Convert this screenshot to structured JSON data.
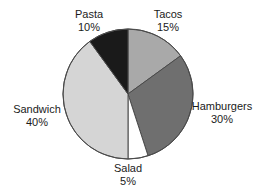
{
  "chart_data": {
    "type": "pie",
    "title": "",
    "subtitle": "",
    "xlabel": "",
    "ylabel": "",
    "legend_position": "none",
    "grid": false,
    "labels_show_percent": true,
    "start_angle_deg": 0,
    "direction": "clockwise",
    "categories": [
      "Tacos",
      "Hamburgers",
      "Salad",
      "Sandwich",
      "Pasta"
    ],
    "values": [
      15,
      30,
      5,
      40,
      10
    ],
    "units": "%",
    "total": 100,
    "slices": [
      {
        "name": "Tacos",
        "value": 15,
        "percent_text": "15%",
        "color": "#a9a9a9",
        "label_text": "Tacos",
        "label_position": "top-right"
      },
      {
        "name": "Hamburgers",
        "value": 30,
        "percent_text": "30%",
        "color": "#6f6f6f",
        "label_text": "Hamburgers",
        "label_position": "right"
      },
      {
        "name": "Salad",
        "value": 5,
        "percent_text": "5%",
        "color": "#ffffff",
        "label_text": "Salad",
        "label_position": "bottom"
      },
      {
        "name": "Sandwich",
        "value": 40,
        "percent_text": "40%",
        "color": "#d5d5d5",
        "label_text": "Sandwich",
        "label_position": "left"
      },
      {
        "name": "Pasta",
        "value": 10,
        "percent_text": "10%",
        "color": "#1a1a1a",
        "label_text": "Pasta",
        "label_position": "top-left"
      }
    ],
    "geometry": {
      "center_x": 128,
      "center_y": 94,
      "radius": 65
    },
    "style": {
      "outline_color": "#4a4a4a",
      "outline_width": 1,
      "background": "#ffffff",
      "text_color": "#1b1b1b"
    }
  }
}
